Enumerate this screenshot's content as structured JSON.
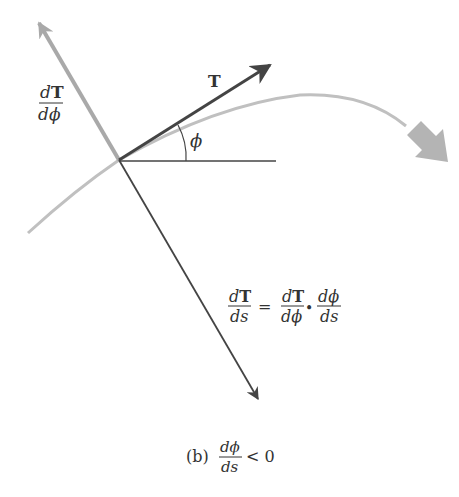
{
  "figure": {
    "vector_T_label": "T",
    "angle_label": "ϕ",
    "dT_dphi_label": {
      "num_d": "d",
      "num_T": "T",
      "den": "dϕ"
    },
    "equation": {
      "lhs": {
        "num_d": "d",
        "num_T": "T",
        "den": "ds"
      },
      "equals": "=",
      "rhs1": {
        "num_d": "d",
        "num_T": "T",
        "den": "dϕ"
      },
      "dot": "•",
      "rhs2": {
        "num": "dϕ",
        "den": "ds"
      }
    },
    "caption": {
      "prefix": "(b)",
      "frac_num": "dϕ",
      "frac_den": "ds",
      "relation": "< 0"
    }
  },
  "colors": {
    "dark_line": "#444444",
    "gray_vector": "#a9a9a9",
    "curve": "#c0c0c0",
    "direction_arrow": "#b4b4b4",
    "text": "#333333"
  }
}
